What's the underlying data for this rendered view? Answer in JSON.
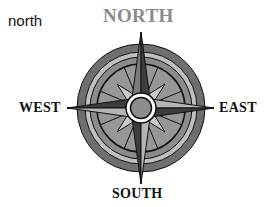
{
  "caption": "north",
  "compass": {
    "labels": {
      "north": "NORTH",
      "south": "SOUTH",
      "east": "EAST",
      "west": "WEST"
    },
    "highlighted": "north",
    "colors": {
      "highlight_label": "#8a8a8a",
      "label": "#111111",
      "outer_ring": "#6f6f6f",
      "light_ring": "#bfbfbf",
      "mid_ring": "#8b8b8b",
      "inner_field": "#979797",
      "diagonal_points": "#c9c9c9",
      "point_dark": "#3d3d3d",
      "point_mid": "#7a7a7a",
      "point_light": "#b5b5b5",
      "center_ring": "#ffffff",
      "center_disc": "#8d8d8d"
    }
  }
}
